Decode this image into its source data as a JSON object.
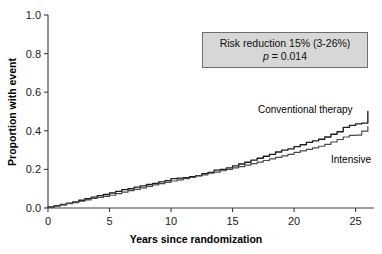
{
  "chart_data": {
    "type": "line",
    "title": "",
    "xlabel": "Years since randomization",
    "ylabel": "Proportion with event",
    "xlim": [
      0,
      26.5
    ],
    "ylim": [
      0,
      1.0
    ],
    "grid": false,
    "legend_position": "inline-curve-labels",
    "xticks": [
      "0",
      "5",
      "10",
      "15",
      "20",
      "25"
    ],
    "xtick_values": [
      0,
      5,
      10,
      15,
      20,
      25
    ],
    "yticks": [
      "0.0",
      "0.2",
      "0.4",
      "0.6",
      "0.8",
      "1.0"
    ],
    "ytick_values": [
      0.0,
      0.2,
      0.4,
      0.6,
      0.8,
      1.0
    ],
    "annotations": [
      {
        "name": "risk-reduction-box",
        "line1": "Risk reduction 15% (3-26%)",
        "line2_symbol": "p",
        "line2_rest": " = 0.014"
      }
    ],
    "series": [
      {
        "name": "Conventional therapy",
        "label": "Conventional therapy",
        "color": "#1c1c1c",
        "x": [
          0,
          0.5,
          1,
          1.5,
          2,
          2.5,
          3,
          3.5,
          4,
          4.5,
          5,
          5.5,
          6,
          6.5,
          7,
          7.5,
          8,
          8.5,
          9,
          9.5,
          10,
          10.5,
          11,
          11.5,
          12,
          12.5,
          13,
          13.5,
          14,
          14.5,
          15,
          15.5,
          16,
          16.5,
          17,
          17.5,
          18,
          18.5,
          19,
          19.5,
          20,
          20.5,
          21,
          21.5,
          22,
          22.5,
          23,
          23.5,
          24,
          24.5,
          25,
          25.5,
          26
        ],
        "values": [
          0.005,
          0.012,
          0.018,
          0.025,
          0.032,
          0.04,
          0.048,
          0.056,
          0.064,
          0.07,
          0.078,
          0.086,
          0.095,
          0.1,
          0.108,
          0.115,
          0.122,
          0.128,
          0.135,
          0.142,
          0.152,
          0.155,
          0.157,
          0.162,
          0.168,
          0.178,
          0.185,
          0.196,
          0.2,
          0.208,
          0.218,
          0.228,
          0.237,
          0.248,
          0.258,
          0.268,
          0.278,
          0.29,
          0.3,
          0.306,
          0.318,
          0.328,
          0.34,
          0.348,
          0.356,
          0.368,
          0.382,
          0.395,
          0.418,
          0.428,
          0.436,
          0.44,
          0.5
        ]
      },
      {
        "name": "Intensive",
        "label": "Intensive",
        "color": "#4a4a4a",
        "x": [
          0,
          0.5,
          1,
          1.5,
          2,
          2.5,
          3,
          3.5,
          4,
          4.5,
          5,
          5.5,
          6,
          6.5,
          7,
          7.5,
          8,
          8.5,
          9,
          9.5,
          10,
          10.5,
          11,
          11.5,
          12,
          12.5,
          13,
          13.5,
          14,
          14.5,
          15,
          15.5,
          16,
          16.5,
          17,
          17.5,
          18,
          18.5,
          19,
          19.5,
          20,
          20.5,
          21,
          21.5,
          22,
          22.5,
          23,
          23.5,
          24,
          24.5,
          25,
          25.5,
          26
        ],
        "values": [
          0.004,
          0.01,
          0.016,
          0.022,
          0.028,
          0.035,
          0.042,
          0.05,
          0.055,
          0.06,
          0.066,
          0.075,
          0.082,
          0.09,
          0.096,
          0.104,
          0.112,
          0.12,
          0.126,
          0.133,
          0.14,
          0.146,
          0.152,
          0.158,
          0.166,
          0.172,
          0.18,
          0.186,
          0.193,
          0.2,
          0.208,
          0.214,
          0.222,
          0.23,
          0.238,
          0.246,
          0.255,
          0.262,
          0.27,
          0.278,
          0.288,
          0.296,
          0.304,
          0.312,
          0.32,
          0.33,
          0.342,
          0.355,
          0.368,
          0.376,
          0.378,
          0.398,
          0.422
        ]
      }
    ]
  }
}
